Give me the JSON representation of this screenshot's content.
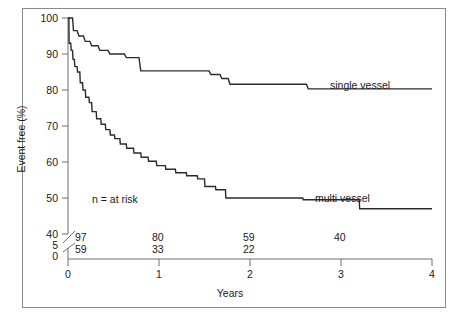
{
  "chart_data": {
    "type": "line",
    "subtype": "kaplan-meier-step",
    "title": "",
    "xlabel": "Years",
    "ylabel": "Event free (%)",
    "xlim": [
      0,
      4
    ],
    "ylim": [
      40,
      100
    ],
    "y_axis_break": true,
    "y_break_labels": [
      "5",
      "0"
    ],
    "xticks": [
      0,
      1,
      2,
      3,
      4
    ],
    "xticklabels": [
      "0",
      "1",
      "2",
      "3",
      "4"
    ],
    "yticks": [
      40,
      50,
      60,
      70,
      80,
      90,
      100
    ],
    "yticklabels": [
      "40",
      "50",
      "60",
      "70",
      "80",
      "90",
      "100"
    ],
    "grid": false,
    "legend_position": "inline-annotation",
    "annotations": [
      {
        "text": "n = at risk",
        "x": 0.35,
        "y": 50.5
      }
    ],
    "series": [
      {
        "name": "single vessel",
        "label": "single vessel",
        "label_x": 2.9,
        "label_y": 84.5,
        "color": "#2b2b2b",
        "points": [
          [
            0.0,
            100.0
          ],
          [
            0.05,
            100.0
          ],
          [
            0.06,
            96.5
          ],
          [
            0.1,
            96.5
          ],
          [
            0.12,
            95.0
          ],
          [
            0.17,
            95.0
          ],
          [
            0.19,
            93.5
          ],
          [
            0.24,
            93.5
          ],
          [
            0.26,
            92.3
          ],
          [
            0.33,
            92.3
          ],
          [
            0.35,
            91.0
          ],
          [
            0.44,
            91.0
          ],
          [
            0.46,
            90.0
          ],
          [
            0.62,
            90.0
          ],
          [
            0.64,
            89.0
          ],
          [
            0.78,
            89.0
          ],
          [
            0.8,
            85.3
          ],
          [
            1.55,
            85.3
          ],
          [
            1.57,
            84.3
          ],
          [
            1.67,
            84.3
          ],
          [
            1.69,
            83.2
          ],
          [
            1.76,
            83.2
          ],
          [
            1.78,
            81.6
          ],
          [
            2.62,
            81.6
          ],
          [
            2.64,
            80.3
          ],
          [
            4.0,
            80.3
          ]
        ]
      },
      {
        "name": "multi vessel",
        "label": "multi vessel",
        "label_x": 2.72,
        "label_y": 51.5,
        "color": "#2b2b2b",
        "points": [
          [
            0.0,
            100.0
          ],
          [
            0.01,
            100.0
          ],
          [
            0.012,
            93.0
          ],
          [
            0.03,
            93.0
          ],
          [
            0.035,
            91.0
          ],
          [
            0.05,
            91.0
          ],
          [
            0.055,
            88.5
          ],
          [
            0.07,
            88.5
          ],
          [
            0.075,
            86.5
          ],
          [
            0.1,
            86.5
          ],
          [
            0.105,
            85.0
          ],
          [
            0.13,
            85.0
          ],
          [
            0.135,
            82.0
          ],
          [
            0.16,
            82.0
          ],
          [
            0.165,
            80.0
          ],
          [
            0.19,
            80.0
          ],
          [
            0.195,
            78.0
          ],
          [
            0.23,
            78.0
          ],
          [
            0.235,
            76.5
          ],
          [
            0.26,
            76.5
          ],
          [
            0.265,
            74.0
          ],
          [
            0.31,
            74.0
          ],
          [
            0.315,
            72.0
          ],
          [
            0.36,
            72.0
          ],
          [
            0.365,
            70.5
          ],
          [
            0.41,
            70.5
          ],
          [
            0.415,
            69.0
          ],
          [
            0.46,
            69.0
          ],
          [
            0.465,
            67.5
          ],
          [
            0.51,
            67.5
          ],
          [
            0.515,
            66.5
          ],
          [
            0.57,
            66.5
          ],
          [
            0.575,
            65.0
          ],
          [
            0.64,
            65.0
          ],
          [
            0.645,
            63.8
          ],
          [
            0.72,
            63.8
          ],
          [
            0.725,
            62.5
          ],
          [
            0.8,
            62.5
          ],
          [
            0.805,
            61.3
          ],
          [
            0.88,
            61.3
          ],
          [
            0.885,
            60.2
          ],
          [
            0.97,
            60.2
          ],
          [
            0.975,
            59.0
          ],
          [
            1.07,
            59.0
          ],
          [
            1.075,
            58.0
          ],
          [
            1.18,
            58.0
          ],
          [
            1.185,
            57.0
          ],
          [
            1.3,
            57.0
          ],
          [
            1.305,
            56.2
          ],
          [
            1.42,
            56.2
          ],
          [
            1.425,
            55.3
          ],
          [
            1.5,
            55.3
          ],
          [
            1.505,
            53.2
          ],
          [
            1.62,
            53.2
          ],
          [
            1.625,
            52.3
          ],
          [
            1.73,
            52.3
          ],
          [
            1.735,
            50.0
          ],
          [
            2.58,
            50.0
          ],
          [
            2.585,
            49.5
          ],
          [
            3.2,
            49.5
          ],
          [
            3.205,
            47.0
          ],
          [
            4.0,
            47.0
          ]
        ]
      }
    ],
    "at_risk": {
      "label": "n = at risk",
      "times": [
        0,
        1,
        2,
        3
      ],
      "rows": [
        {
          "series": "single vessel",
          "counts": [
            "97",
            "80",
            "59",
            "40"
          ]
        },
        {
          "series": "multi vessel",
          "counts": [
            "59",
            "33",
            "22",
            ""
          ]
        }
      ]
    }
  }
}
